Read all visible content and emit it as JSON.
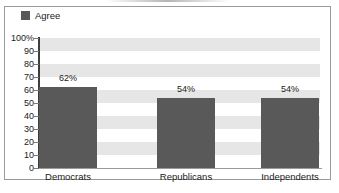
{
  "chart_data": {
    "type": "bar",
    "title": "",
    "xlabel": "",
    "ylabel": "",
    "categories": [
      "Democrats",
      "Republicans",
      "Independents"
    ],
    "values": [
      62,
      54,
      54
    ],
    "value_labels": [
      "62%",
      "54%",
      "54%"
    ],
    "series": [
      {
        "name": "Agree",
        "values": [
          62,
          54,
          54
        ],
        "color": "#595959"
      }
    ],
    "ylim": [
      0,
      100
    ],
    "y_ticks": [
      0,
      10,
      20,
      30,
      40,
      50,
      60,
      70,
      80,
      90,
      100
    ],
    "y_tick_labels": [
      "0",
      "10",
      "20",
      "30",
      "40",
      "50",
      "60",
      "70",
      "80",
      "90",
      "100%"
    ],
    "grid": "alternating-horizontal-bands",
    "legend_position": "top-left"
  },
  "legend": {
    "entries": [
      {
        "label": "Agree",
        "color": "#595959"
      }
    ]
  },
  "colors": {
    "bar": "#595959",
    "band": "#e6e6e6",
    "axis": "#3d3d3d",
    "frame": "#9a9a9a",
    "text": "#1a1a1a",
    "background": "#ffffff"
  }
}
